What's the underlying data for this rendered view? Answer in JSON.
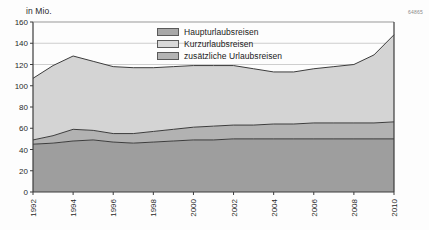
{
  "unit_label": "in Mio.",
  "source_code": "64865",
  "legend": {
    "items": [
      {
        "label": "Haupturlaubsreisen",
        "color": "#a8a8a8"
      },
      {
        "label": "Kurzurlaubsreisen",
        "color": "#d8d8d8"
      },
      {
        "label": "zusätzliche Urlaubsreisen",
        "color": "#b4b4b4"
      }
    ]
  },
  "chart_data": {
    "type": "area",
    "title": "",
    "subtitle": "",
    "xlabel": "",
    "ylabel": "in Mio.",
    "ylim": [
      0,
      160
    ],
    "yticks": [
      0,
      20,
      40,
      60,
      80,
      100,
      120,
      140,
      160
    ],
    "ytick_labels": [
      "0",
      "20",
      "40",
      "60",
      "80",
      "100",
      "120",
      "140",
      "160"
    ],
    "grid": true,
    "legend_position": "top-center",
    "stacked": true,
    "x": [
      1992,
      1993,
      1994,
      1995,
      1996,
      1997,
      1998,
      1999,
      2000,
      2001,
      2002,
      2003,
      2004,
      2005,
      2006,
      2007,
      2008,
      2009,
      2010
    ],
    "xticks": [
      1992,
      1994,
      1996,
      1998,
      2000,
      2002,
      2004,
      2006,
      2008,
      2010
    ],
    "xtick_labels": [
      "1992",
      "1994",
      "1996",
      "1998",
      "2000",
      "2002",
      "2004",
      "2006",
      "2008",
      "2010"
    ],
    "series": [
      {
        "name": "Haupturlaubsreisen",
        "color": "#9e9e9e",
        "values": [
          45,
          46,
          48,
          49,
          47,
          46,
          47,
          48,
          49,
          49,
          50,
          50,
          50,
          50,
          50,
          50,
          50,
          50,
          50
        ]
      },
      {
        "name": "Kurzurlaubsreisen",
        "color": "#b2b2b2",
        "values": [
          4,
          7,
          11,
          9,
          8,
          9,
          10,
          11,
          12,
          13,
          13,
          13,
          14,
          14,
          15,
          15,
          15,
          15,
          16
        ]
      },
      {
        "name": "zusätzliche Urlaubsreisen",
        "color": "#d4d4d4",
        "values": [
          58,
          66,
          69,
          65,
          63,
          62,
          60,
          59,
          58,
          57,
          56,
          53,
          49,
          49,
          51,
          53,
          55,
          64,
          82
        ]
      }
    ],
    "totals": [
      107,
      119,
      128,
      123,
      118,
      117,
      117,
      118,
      119,
      119,
      119,
      116,
      113,
      113,
      116,
      118,
      120,
      129,
      148
    ],
    "cumulative_band1": [
      45,
      46,
      48,
      49,
      47,
      46,
      47,
      48,
      49,
      49,
      50,
      50,
      50,
      50,
      50,
      50,
      50,
      50,
      50
    ],
    "cumulative_band2": [
      49,
      53,
      59,
      58,
      55,
      55,
      57,
      59,
      61,
      62,
      63,
      63,
      64,
      64,
      65,
      65,
      65,
      65,
      66
    ]
  }
}
